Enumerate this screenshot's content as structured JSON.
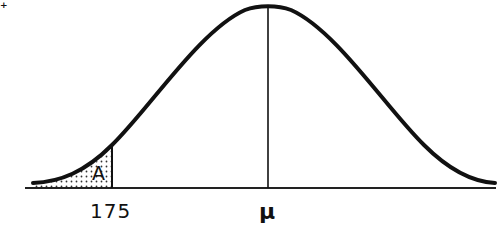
{
  "diagram": {
    "type": "normal-distribution-curve",
    "shaded_region_label": "A",
    "x_labels": {
      "cutoff": "175",
      "mean": "μ"
    },
    "corner_mark": "+",
    "colors": {
      "curve": "#111111",
      "axis": "#222222",
      "shading_dots": "#333333",
      "background": "#ffffff"
    }
  }
}
